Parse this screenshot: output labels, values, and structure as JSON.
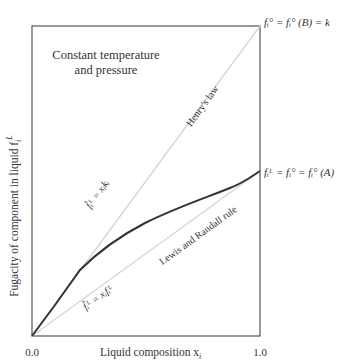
{
  "diagram": {
    "type": "fugacity-vs-composition",
    "condition_label_line1": "Constant temperature",
    "condition_label_line2": "and pressure",
    "x_axis": {
      "label": "Liquid composition x",
      "label_sub": "i",
      "tick_min": "0.0",
      "tick_max": "1.0"
    },
    "y_axis": {
      "label": "Fugacity of component in liquid f",
      "label_sub": "i",
      "label_sup": "L"
    },
    "lines": {
      "henry": {
        "name": "Henry's law",
        "equation": "f̂ᵢᴸ = xᵢkᵢ",
        "color": "#d4d4d4"
      },
      "lewis_randall": {
        "name": "Lewis and Randall rule",
        "equation": "f̂ᵢᴸ = xᵢfᵢᴸ",
        "color": "#d4d4d4"
      },
      "actual": {
        "color": "#333333"
      }
    },
    "endpoint_labels": {
      "top_right": "fᵢ° = fᵢ° (B) = k",
      "mid_right": "fᵢᴸ = fᵢ° = fᵢ° (A)"
    }
  }
}
